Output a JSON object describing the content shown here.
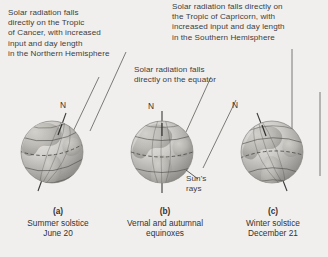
{
  "figure": {
    "background_color": "#f1efed",
    "text_color": "#3d3d3d"
  },
  "annotations": {
    "tropic_of_cancer": "Solar radiation falls\ndirectly on the Tropic\nof Cancer, with increased\ninput and day length\nin the Northern Hemisphere",
    "tropic_of_capricorn": "Solar radiation falls directly on\nthe Tropic of Capricorn, with\nincreased input and day length\nin the Southern Hemisphere",
    "equator": "Solar radiation falls\ndirectly on the equator",
    "suns_rays": "Sun's\nrays"
  },
  "globes": [
    {
      "id": "a",
      "pole_label": "N",
      "axis_tilt": "toward-sun",
      "caption_letter": "(a)",
      "caption_line1": "Summer solstice",
      "caption_line2": "June 20"
    },
    {
      "id": "b",
      "pole_label": "N",
      "axis_tilt": "upright",
      "caption_letter": "(b)",
      "caption_line1": "Vernal and autumnal",
      "caption_line2": "equinoxes"
    },
    {
      "id": "c",
      "pole_label": "N",
      "axis_tilt": "away-from-sun",
      "caption_letter": "(c)",
      "caption_line1": "Winter solstice",
      "caption_line2": "December 21"
    }
  ]
}
